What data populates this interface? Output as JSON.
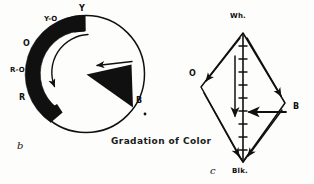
{
  "figure": {
    "caption": "Gradation of Color",
    "background_color": "#fdfdfb",
    "ink_color": "#101010"
  },
  "color_wheel": {
    "figure_label": "b",
    "shape": "circle",
    "band_description": "solid black arc band running from Y clockwise-back through Y-O, O, R-O to R",
    "band_start_label": "Y",
    "band_end_label": "R",
    "labels": [
      {
        "text": "Y",
        "name": "label-yellow",
        "x": 79,
        "y": 9
      },
      {
        "text": "Y-O",
        "name": "label-yellow-orange",
        "x": 46,
        "y": 19
      },
      {
        "text": "O",
        "name": "label-orange",
        "x": 25,
        "y": 44
      },
      {
        "text": "R-O",
        "name": "label-red-orange",
        "x": 14,
        "y": 70
      },
      {
        "text": "R",
        "name": "label-red",
        "x": 21,
        "y": 97
      },
      {
        "text": "B",
        "name": "label-blue",
        "x": 137,
        "y": 100
      }
    ],
    "curved_arrow": "counterclockwise arrow inside band from Y toward R",
    "straight_arrow": "leftward arrow over the black wedge pointing to center",
    "wedge": "solid black triangular wedge from center toward B"
  },
  "value_diamond": {
    "figure_label": "c",
    "shape": "diamond",
    "vertices": [
      {
        "text": "Wh.",
        "name": "label-white",
        "x": 228,
        "y": 14
      },
      {
        "text": "O",
        "name": "label-orange-vertex",
        "x": 190,
        "y": 73
      },
      {
        "text": "B",
        "name": "label-blue-vertex",
        "x": 292,
        "y": 105
      },
      {
        "text": "Blk.",
        "name": "label-black-vertex",
        "x": 232,
        "y": 170
      }
    ],
    "scale_ticks": 9,
    "arrows": [
      "Wh. to O (down-left)",
      "Wh. to B (down-right)",
      "O to Blk. (down-right)",
      "B to Blk. (down-left)",
      "vertical Wh. to Blk. (down)",
      "B to center axis (left)"
    ]
  }
}
